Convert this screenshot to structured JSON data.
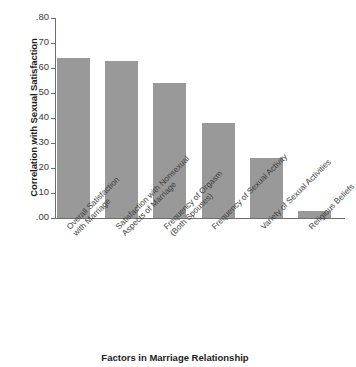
{
  "chart_data": {
    "type": "bar",
    "title": "",
    "xlabel": "Factors in Marriage Relationship",
    "ylabel": "Correlation with Sexual Satisfaction",
    "ylim": [
      0.0,
      0.8
    ],
    "ytick_labels": [
      ".80",
      ".70",
      ".60",
      ".50",
      ".40",
      ".30",
      ".20",
      ".10",
      ".00"
    ],
    "ytick_values": [
      0.8,
      0.7,
      0.6,
      0.5,
      0.4,
      0.3,
      0.2,
      0.1,
      0.0
    ],
    "grid": false,
    "legend": "none",
    "bar_color": "#999999",
    "axis_color": "#6e6e6e",
    "categories": [
      "Overall Satisfaction with Marriage",
      "Satisfaction with Nonsexual Aspects of Marriage",
      "Frequency of Orgasm (Both Spouses)",
      "Frequency of Sexual Activity",
      "Variety of Sexual Activities",
      "Religious Beliefs"
    ],
    "category_lines": [
      [
        "Overall Satisfaction",
        "with Marriage"
      ],
      [
        "Satisfaction with Nonsexual",
        "Aspects of Marriage"
      ],
      [
        "Frequency of Orgasm",
        "(Both Spouses)"
      ],
      [
        "Frequency of Sexual Activity",
        ""
      ],
      [
        "Variety of Sexual Activities",
        ""
      ],
      [
        "Religious Beliefs",
        ""
      ]
    ],
    "values": [
      0.64,
      0.63,
      0.54,
      0.38,
      0.24,
      0.03
    ]
  }
}
